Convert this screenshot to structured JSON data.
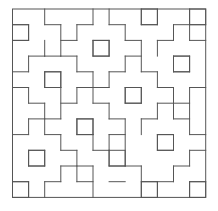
{
  "figure": {
    "grid": {
      "cols": 12,
      "rows": 12
    },
    "origin_px": [
      12.5,
      9
    ],
    "cell_px": [
      16.1,
      15.7
    ],
    "stroke_color": "#555555",
    "background_color": "#ffffff",
    "unit_squares": [
      [
        8,
        0
      ],
      [
        11,
        0
      ],
      [
        0,
        1
      ],
      [
        5,
        2
      ],
      [
        10,
        3
      ],
      [
        2,
        4
      ],
      [
        7,
        5
      ],
      [
        4,
        7
      ],
      [
        9,
        8
      ],
      [
        1,
        9
      ],
      [
        6,
        9
      ],
      [
        0,
        11
      ],
      [
        8,
        11
      ],
      [
        11,
        11
      ]
    ],
    "horizontal_edges": [
      [
        1,
        2,
        3
      ],
      [
        1,
        4,
        5
      ],
      [
        1,
        10,
        11
      ],
      [
        1,
        11,
        12
      ],
      [
        1,
        0,
        1
      ],
      [
        1,
        6,
        7
      ],
      [
        1,
        8,
        9
      ],
      [
        2,
        0,
        1
      ],
      [
        2,
        3,
        4
      ],
      [
        2,
        7,
        8
      ],
      [
        2,
        9,
        10
      ],
      [
        2,
        5,
        6
      ],
      [
        2,
        11,
        12
      ],
      [
        3,
        1,
        2
      ],
      [
        3,
        3,
        4
      ],
      [
        3,
        5,
        6
      ],
      [
        3,
        7,
        8
      ],
      [
        3,
        10,
        11
      ],
      [
        3,
        2,
        3
      ],
      [
        4,
        2,
        3
      ],
      [
        4,
        4,
        5
      ],
      [
        4,
        6,
        7
      ],
      [
        4,
        8,
        9
      ],
      [
        4,
        0,
        1
      ],
      [
        4,
        10,
        11
      ],
      [
        5,
        0,
        1
      ],
      [
        5,
        4,
        5
      ],
      [
        5,
        5,
        6
      ],
      [
        5,
        9,
        10
      ],
      [
        5,
        11,
        12
      ],
      [
        5,
        2,
        3
      ],
      [
        5,
        7,
        8
      ],
      [
        6,
        1,
        2
      ],
      [
        6,
        3,
        4
      ],
      [
        6,
        5,
        6
      ],
      [
        6,
        10,
        11
      ],
      [
        6,
        9,
        10
      ],
      [
        6,
        7,
        8
      ],
      [
        7,
        1,
        2
      ],
      [
        7,
        2,
        3
      ],
      [
        7,
        6,
        7
      ],
      [
        7,
        8,
        9
      ],
      [
        7,
        10,
        11
      ],
      [
        7,
        4,
        5
      ],
      [
        8,
        0,
        1
      ],
      [
        8,
        2,
        3
      ],
      [
        8,
        6,
        7
      ],
      [
        8,
        9,
        10
      ],
      [
        8,
        11,
        12
      ],
      [
        8,
        4,
        5
      ],
      [
        9,
        5,
        6
      ],
      [
        9,
        3,
        4
      ],
      [
        9,
        11,
        12
      ],
      [
        9,
        1,
        2
      ],
      [
        9,
        9,
        10
      ],
      [
        10,
        4,
        5
      ],
      [
        10,
        7,
        8
      ],
      [
        10,
        10,
        11
      ],
      [
        10,
        1,
        2
      ],
      [
        10,
        6,
        7
      ],
      [
        10,
        3,
        4
      ],
      [
        11,
        0,
        1
      ],
      [
        11,
        2,
        3
      ],
      [
        11,
        4,
        5
      ],
      [
        11,
        8,
        9
      ],
      [
        11,
        9,
        10
      ],
      [
        11,
        11,
        12
      ],
      [
        11,
        6,
        7
      ]
    ],
    "vertical_edges": [
      [
        1,
        1,
        2
      ],
      [
        1,
        3,
        4
      ],
      [
        1,
        5,
        6
      ],
      [
        1,
        7,
        8
      ],
      [
        1,
        9,
        10
      ],
      [
        1,
        11,
        12
      ],
      [
        2,
        0,
        1
      ],
      [
        2,
        2,
        3
      ],
      [
        2,
        4,
        5
      ],
      [
        2,
        6,
        8
      ],
      [
        2,
        9,
        10
      ],
      [
        2,
        11,
        12
      ],
      [
        3,
        1,
        3
      ],
      [
        3,
        4,
        5
      ],
      [
        3,
        5,
        7
      ],
      [
        3,
        8,
        9
      ],
      [
        3,
        10,
        11
      ],
      [
        4,
        1,
        2
      ],
      [
        4,
        3,
        4
      ],
      [
        4,
        5,
        6
      ],
      [
        4,
        7,
        8
      ],
      [
        4,
        9,
        11
      ],
      [
        5,
        0,
        1
      ],
      [
        5,
        2,
        3
      ],
      [
        5,
        4,
        6
      ],
      [
        5,
        7,
        8
      ],
      [
        5,
        8,
        9
      ],
      [
        5,
        10,
        12
      ],
      [
        6,
        0,
        1
      ],
      [
        6,
        2,
        3
      ],
      [
        6,
        4,
        5
      ],
      [
        6,
        6,
        7
      ],
      [
        6,
        8,
        9
      ],
      [
        6,
        9,
        10
      ],
      [
        7,
        1,
        2
      ],
      [
        7,
        3,
        4
      ],
      [
        7,
        5,
        6
      ],
      [
        7,
        7,
        10
      ],
      [
        8,
        0,
        1
      ],
      [
        8,
        2,
        4
      ],
      [
        8,
        5,
        6
      ],
      [
        8,
        7,
        8
      ],
      [
        8,
        10,
        12
      ],
      [
        9,
        0,
        1
      ],
      [
        9,
        2,
        3
      ],
      [
        9,
        4,
        5
      ],
      [
        9,
        6,
        7
      ],
      [
        9,
        8,
        9
      ],
      [
        9,
        11,
        12
      ],
      [
        10,
        1,
        2
      ],
      [
        10,
        3,
        4
      ],
      [
        10,
        5,
        7
      ],
      [
        10,
        8,
        9
      ],
      [
        10,
        10,
        11
      ],
      [
        11,
        0,
        2
      ],
      [
        11,
        3,
        4
      ],
      [
        11,
        5,
        8
      ],
      [
        11,
        9,
        10
      ],
      [
        11,
        11,
        12
      ]
    ]
  }
}
